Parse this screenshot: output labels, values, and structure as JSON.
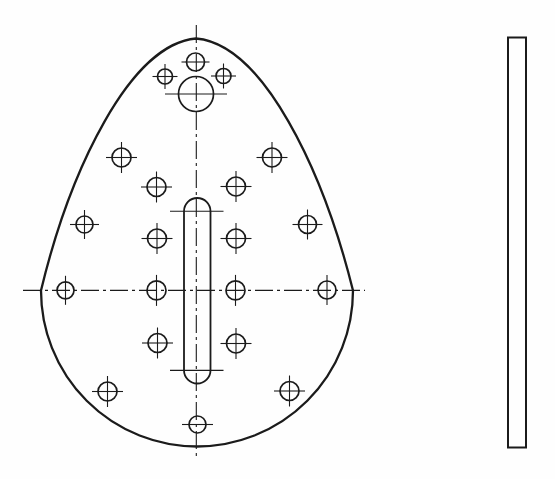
{
  "canvas": {
    "width": 555,
    "height": 479,
    "background": "#fefefe",
    "ink": "#1b1b1b"
  },
  "drawing": {
    "front_view": {
      "outline": {
        "path": "M 196 38.5 C 263 44 323 170 353 290.5 A 156 156 0 0 1 41 290.5 C 70 170 130 44 196 38.5 Z",
        "stroke_width": 2.3
      },
      "centerlines": {
        "vertical": {
          "x": 196.3,
          "y1": 25,
          "y2": 459
        },
        "horizontal": {
          "y": 290.4,
          "x1": 23,
          "x2": 365
        },
        "dash": "18 4 3 4",
        "stroke_width": 1.1
      },
      "slot": {
        "x": 184,
        "y": 198,
        "width": 26.5,
        "height": 185.5,
        "rx": 13.25,
        "stroke_width": 1.8,
        "cross_y": [
          211.2,
          370.4
        ],
        "cross_x1": 170,
        "cross_x2": 223.5,
        "cross_stroke_width": 1.1
      },
      "crosshair_overhang": 6,
      "crosshair_stroke_width": 1.1,
      "hole_stroke_width": 1.7,
      "holes": [
        {
          "cx": 195.5,
          "cy": 62,
          "r": 9,
          "cross": "h",
          "overhang": 5
        },
        {
          "cx": 165,
          "cy": 76.5,
          "r": 7.5,
          "cross": "both",
          "overhang": 5
        },
        {
          "cx": 223.5,
          "cy": 76,
          "r": 7.5,
          "cross": "both",
          "overhang": 5
        },
        {
          "cx": 196,
          "cy": 94,
          "r": 17.5,
          "cross": "h",
          "overhang": 13.5
        },
        {
          "cx": 121.5,
          "cy": 157.5,
          "r": 9.5,
          "cross": "both"
        },
        {
          "cx": 272,
          "cy": 157.5,
          "r": 9.5,
          "cross": "both"
        },
        {
          "cx": 156.5,
          "cy": 187,
          "r": 9.5,
          "cross": "both"
        },
        {
          "cx": 236,
          "cy": 186.5,
          "r": 9.5,
          "cross": "both"
        },
        {
          "cx": 84.5,
          "cy": 224.5,
          "r": 8.5,
          "cross": "both"
        },
        {
          "cx": 307.5,
          "cy": 224.5,
          "r": 9,
          "cross": "both"
        },
        {
          "cx": 157,
          "cy": 238.5,
          "r": 9.5,
          "cross": "both"
        },
        {
          "cx": 236,
          "cy": 238.5,
          "r": 9.5,
          "cross": "both"
        },
        {
          "cx": 65.5,
          "cy": 290.3,
          "r": 8.5,
          "cross": "v"
        },
        {
          "cx": 156.5,
          "cy": 290.4,
          "r": 9.5,
          "cross": "v"
        },
        {
          "cx": 235.5,
          "cy": 290.4,
          "r": 9.5,
          "cross": "v"
        },
        {
          "cx": 327,
          "cy": 290,
          "r": 9,
          "cross": "v"
        },
        {
          "cx": 157.5,
          "cy": 343,
          "r": 9.5,
          "cross": "both"
        },
        {
          "cx": 236,
          "cy": 343.5,
          "r": 9.5,
          "cross": "both"
        },
        {
          "cx": 107.5,
          "cy": 391.5,
          "r": 9.5,
          "cross": "both"
        },
        {
          "cx": 289.5,
          "cy": 391,
          "r": 9.5,
          "cross": "both"
        },
        {
          "cx": 197.5,
          "cy": 424.5,
          "r": 8.5,
          "cross": "h",
          "overhang": 7
        }
      ]
    },
    "side_view": {
      "x": 508,
      "y": 37.5,
      "width": 18,
      "height": 410,
      "stroke_width": 2,
      "fill": "#fefefe"
    }
  }
}
